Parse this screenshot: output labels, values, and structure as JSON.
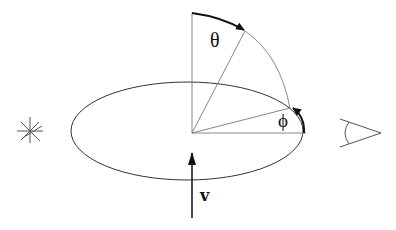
{
  "diagram": {
    "type": "geometry-schematic",
    "labels": {
      "theta": "θ",
      "phi": "ϕ",
      "velocity": "v"
    },
    "elements": {
      "source": "star-icon",
      "observer": "eye-icon",
      "orbit": "ellipse",
      "velocity_vector": "arrow-up"
    },
    "colors": {
      "thin_line": "#7a7a7a",
      "ellipse": "#333333",
      "thick_arrow": "#111111",
      "background": "#ffffff"
    }
  }
}
